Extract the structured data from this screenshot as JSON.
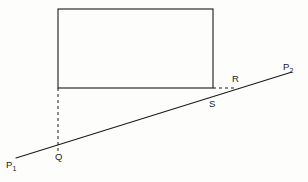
{
  "figure": {
    "type": "geometry-diagram",
    "width": 308,
    "height": 182,
    "background_color": "#fdfdfc",
    "stroke_color": "#1a1a1a"
  },
  "labels": {
    "p1_main": "P",
    "p1_sub": "1",
    "p2_main": "P",
    "p2_sub": "2",
    "q": "Q",
    "r": "R",
    "s": "S"
  },
  "geometry": {
    "rectangle": {
      "x": 58,
      "y": 9,
      "width": 155,
      "height": 79,
      "stroke": "#1a1a1a",
      "stroke_width": 1.1,
      "fill": "none"
    },
    "line_p1_p2": {
      "x1": 16,
      "y1": 158,
      "x2": 292,
      "y2": 72,
      "stroke": "#1a1a1a",
      "stroke_width": 1.1
    },
    "dashed_vertical": {
      "x1": 58,
      "y1": 88,
      "x2": 58,
      "y2": 152,
      "stroke": "#1a1a1a",
      "stroke_width": 1.0,
      "dash": "3,3"
    },
    "dashed_horizontal": {
      "x1": 213,
      "y1": 88,
      "x2": 236,
      "y2": 88,
      "stroke": "#1a1a1a",
      "stroke_width": 1.0,
      "dash": "3,3"
    },
    "points": {
      "p1": {
        "x": 16,
        "y": 158
      },
      "q": {
        "x": 58,
        "y": 145
      },
      "s": {
        "x": 213,
        "y": 97
      },
      "r": {
        "x": 236,
        "y": 88
      },
      "p2": {
        "x": 292,
        "y": 72
      }
    }
  },
  "label_positions": {
    "p1": {
      "left": 6,
      "top": 160
    },
    "q": {
      "left": 55,
      "top": 152
    },
    "s": {
      "left": 209,
      "top": 99
    },
    "r": {
      "left": 232,
      "top": 74
    },
    "p2": {
      "left": 283,
      "top": 62
    }
  }
}
